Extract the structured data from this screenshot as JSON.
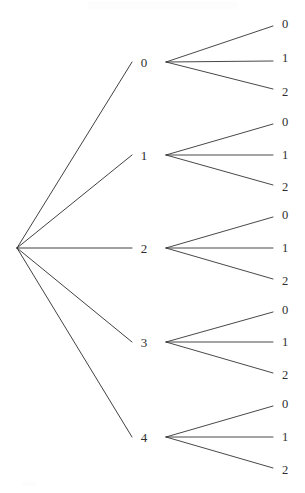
{
  "diagram": {
    "type": "tree",
    "background_color": "#ffffff",
    "line_color": "#2b2b2b",
    "text_color": "#2e2e2e",
    "root": {
      "label": "",
      "x": 17,
      "y": 248
    },
    "level1_label_x": 144,
    "level1_node_x": 166,
    "leaf_line_end_x": 273,
    "leaf_label_x": 285,
    "branches": [
      {
        "label": "0",
        "x": 144,
        "y": 62,
        "node_x": 166,
        "node_y": 62,
        "leaves": [
          {
            "label": "0",
            "x": 285,
            "y": 24,
            "line_end_y": 26
          },
          {
            "label": "1",
            "x": 285,
            "y": 58,
            "line_end_y": 61
          },
          {
            "label": "2",
            "x": 285,
            "y": 92,
            "line_end_y": 89
          }
        ]
      },
      {
        "label": "1",
        "x": 144,
        "y": 155,
        "node_x": 166,
        "node_y": 155,
        "leaves": [
          {
            "label": "0",
            "x": 285,
            "y": 122,
            "line_end_y": 124
          },
          {
            "label": "1",
            "x": 285,
            "y": 155,
            "line_end_y": 155
          },
          {
            "label": "2",
            "x": 285,
            "y": 187,
            "line_end_y": 185
          }
        ]
      },
      {
        "label": "2",
        "x": 144,
        "y": 248,
        "node_x": 166,
        "node_y": 248,
        "leaves": [
          {
            "label": "0",
            "x": 285,
            "y": 215,
            "line_end_y": 217
          },
          {
            "label": "1",
            "x": 285,
            "y": 248,
            "line_end_y": 248
          },
          {
            "label": "2",
            "x": 285,
            "y": 281,
            "line_end_y": 279
          }
        ]
      },
      {
        "label": "3",
        "x": 144,
        "y": 342,
        "node_x": 166,
        "node_y": 342,
        "leaves": [
          {
            "label": "0",
            "x": 285,
            "y": 310,
            "line_end_y": 312
          },
          {
            "label": "1",
            "x": 285,
            "y": 342,
            "line_end_y": 342
          },
          {
            "label": "2",
            "x": 285,
            "y": 375,
            "line_end_y": 373
          }
        ]
      },
      {
        "label": "4",
        "x": 144,
        "y": 437,
        "node_x": 166,
        "node_y": 437,
        "leaves": [
          {
            "label": "0",
            "x": 285,
            "y": 404,
            "line_end_y": 406
          },
          {
            "label": "1",
            "x": 285,
            "y": 437,
            "line_end_y": 437
          },
          {
            "label": "2",
            "x": 285,
            "y": 470,
            "line_end_y": 468
          }
        ]
      }
    ]
  }
}
